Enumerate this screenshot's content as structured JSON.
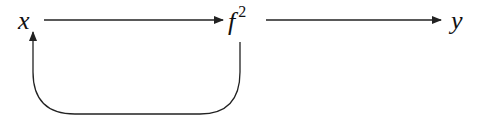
{
  "nodes": {
    "x": {
      "label": "x"
    },
    "f2": {
      "label": "f",
      "superscript": "2"
    },
    "y": {
      "label": "y"
    }
  },
  "edges": [
    {
      "from": "x",
      "to": "f2",
      "type": "straight-arrow"
    },
    {
      "from": "f2",
      "to": "y",
      "type": "straight-arrow"
    },
    {
      "from": "f2",
      "to": "x",
      "type": "curved-feedback-arrow"
    }
  ],
  "colors": {
    "stroke": "#222222",
    "background": "#ffffff"
  }
}
